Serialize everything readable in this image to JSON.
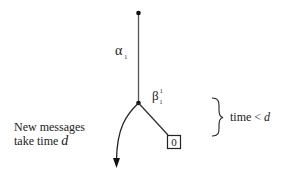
{
  "diagram": {
    "labels": {
      "alpha": {
        "base": "α",
        "sub": "1"
      },
      "beta": {
        "base": "β",
        "sup": "1",
        "sub": "1"
      },
      "box_value": "0",
      "brace_text_prefix": "time < ",
      "brace_text_var": "d",
      "left_line1": "New messages",
      "left_line2_prefix": "take time ",
      "left_line2_var": "d"
    },
    "colors": {
      "line": "#555555",
      "text": "#222222",
      "node": "#111111"
    }
  }
}
